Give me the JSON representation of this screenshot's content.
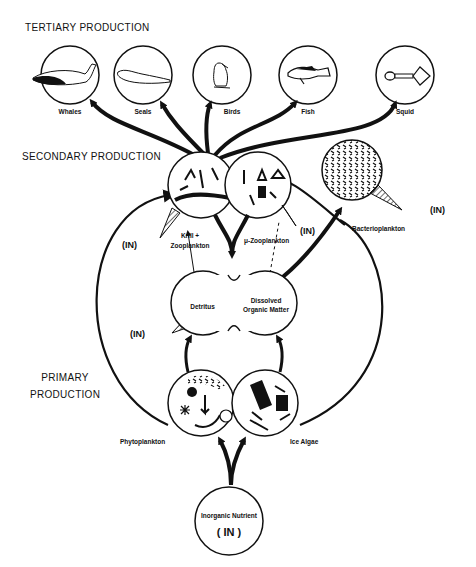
{
  "sections": {
    "tertiary": "TERTIARY PRODUCTION",
    "secondary": "SECONDARY PRODUCTION",
    "primary_line1": "PRIMARY",
    "primary_line2": "PRODUCTION"
  },
  "tertiary_nodes": [
    {
      "label": "Whales",
      "icon": "whale-icon"
    },
    {
      "label": "Seals",
      "icon": "seal-icon"
    },
    {
      "label": "Birds",
      "icon": "penguin-icon"
    },
    {
      "label": "Fish",
      "icon": "fish-icon"
    },
    {
      "label": "Squid",
      "icon": "squid-icon"
    }
  ],
  "secondary_nodes": {
    "krill_line1": "Krill  +",
    "krill_line2": "Zooplankton",
    "micro_zoo": "μ-Zooplankton",
    "bacterio": "Bacterioplankton"
  },
  "detritus_nodes": {
    "detritus": "Detritus",
    "dom_line1": "Dissolved",
    "dom_line2": "Organic Matter"
  },
  "primary_nodes": {
    "phyto": "Phytoplankton",
    "ice_algae": "Ice Algae"
  },
  "nutrient": {
    "line1": "Inorganic Nutrient",
    "line2": "( IN )"
  },
  "in_labels": {
    "krill_out": "(IN)",
    "micro_out": "(IN)",
    "bacterio_out": "(IN)",
    "detritus_out": "(IN)"
  },
  "colors": {
    "ink": "#111111",
    "background": "#ffffff"
  }
}
